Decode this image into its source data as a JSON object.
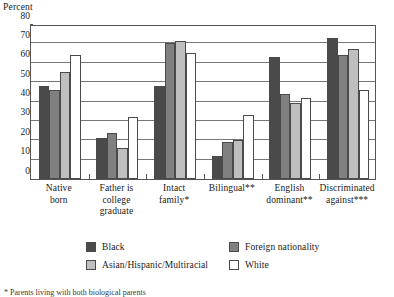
{
  "chart_data": {
    "type": "bar",
    "title": "",
    "subtitle": "",
    "xlabel": "",
    "ylabel": "Percent",
    "ylim": [
      0,
      80
    ],
    "ytick_step": 10,
    "yticks": [
      0,
      10,
      20,
      30,
      40,
      50,
      60,
      70,
      80
    ],
    "ytick_labels": [
      "0",
      "10",
      "20",
      "30",
      "40",
      "50",
      "60",
      "70",
      "80"
    ],
    "grid": true,
    "grid_axis": "y",
    "legend_position": "bottom",
    "categories": [
      "Native born",
      "Father is college graduate",
      "Intact family*",
      "Bilingual**",
      "English dominant**",
      "Discriminated against***"
    ],
    "category_lines": [
      [
        "Native",
        "born"
      ],
      [
        "Father is",
        "college",
        "graduate"
      ],
      [
        "Intact",
        "family*"
      ],
      [
        "Bilingual**"
      ],
      [
        "English",
        "dominant**"
      ],
      [
        "Discriminated",
        "against***"
      ]
    ],
    "series": [
      {
        "name": "Black",
        "color": "#4a4a4a",
        "values": [
          48,
          21,
          48,
          12,
          63,
          73
        ]
      },
      {
        "name": "Foreign nationality",
        "color": "#808080",
        "values": [
          46,
          24,
          70,
          19,
          44,
          64
        ]
      },
      {
        "name": "Asian/Hispanic/Multiracial",
        "color": "#bfbfbf",
        "values": [
          55,
          16,
          71,
          20,
          39,
          67
        ]
      },
      {
        "name": "White",
        "color": "#ffffff",
        "values": [
          64,
          32,
          65,
          33,
          42,
          46
        ]
      }
    ],
    "annotations": []
  },
  "axis": {
    "y_title": "Percent"
  },
  "legend": {
    "items": [
      {
        "label": "Black",
        "color": "#4a4a4a"
      },
      {
        "label": "Foreign nationality",
        "color": "#808080"
      },
      {
        "label": "Asian/Hispanic/Multiracial",
        "color": "#bfbfbf"
      },
      {
        "label": "White",
        "color": "#ffffff"
      }
    ]
  },
  "footnote": {
    "text": "* Parents living with both biological parents"
  }
}
